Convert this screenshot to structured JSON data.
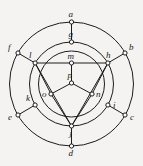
{
  "figure": {
    "top_strip_text": "· · · ··· ·· ·· · · ·· ·",
    "stroke_color": "#1c1c1c",
    "node_fill": "#ffffff",
    "background_color": "#f4f3f1",
    "canvas": {
      "width": 143,
      "height": 166
    },
    "center": {
      "x": 71.5,
      "y": 84
    },
    "circles": [
      {
        "name": "outer-circle",
        "radius": 62
      },
      {
        "name": "middle-circle",
        "radius": 42
      },
      {
        "name": "inner-circle",
        "radius": 33
      }
    ],
    "vertices": [
      {
        "id": "a",
        "label": "a",
        "ring": "outer",
        "x": 71.5,
        "y": 22,
        "label_dx": -3,
        "label_dy": -12
      },
      {
        "id": "b",
        "label": "b",
        "ring": "outer",
        "x": 125,
        "y": 53,
        "label_dx": 4,
        "label_dy": -10
      },
      {
        "id": "c",
        "label": "c",
        "ring": "outer",
        "x": 125,
        "y": 115,
        "label_dx": 5,
        "label_dy": -2
      },
      {
        "id": "d",
        "label": "d",
        "ring": "outer",
        "x": 71.5,
        "y": 146,
        "label_dx": -3,
        "label_dy": 3
      },
      {
        "id": "e",
        "label": "e",
        "ring": "outer",
        "x": 18,
        "y": 115,
        "label_dx": -10,
        "label_dy": -2
      },
      {
        "id": "f",
        "label": "f",
        "ring": "outer",
        "x": 18,
        "y": 53,
        "label_dx": -10,
        "label_dy": -10
      },
      {
        "id": "g",
        "label": "g",
        "ring": "middle",
        "x": 71.5,
        "y": 42,
        "label_dx": -3,
        "label_dy": -12
      },
      {
        "id": "h",
        "label": "h",
        "ring": "middle",
        "x": 107.9,
        "y": 63,
        "label_dx": -2,
        "label_dy": -12
      },
      {
        "id": "i",
        "label": "i",
        "ring": "middle",
        "x": 107.9,
        "y": 105,
        "label_dx": 5,
        "label_dy": -4
      },
      {
        "id": "j",
        "label": "j",
        "ring": "middle",
        "x": 71.5,
        "y": 126,
        "label_dx": -2,
        "label_dy": 3
      },
      {
        "id": "k",
        "label": "k",
        "ring": "middle",
        "x": 35.1,
        "y": 105,
        "label_dx": -9,
        "label_dy": -11
      },
      {
        "id": "l",
        "label": "l",
        "ring": "middle",
        "x": 35.1,
        "y": 63,
        "label_dx": -6,
        "label_dy": -12
      },
      {
        "id": "m",
        "label": "m",
        "ring": "inner",
        "x": 71.5,
        "y": 63,
        "label_dx": -4,
        "label_dy": -11
      },
      {
        "id": "n",
        "label": "n",
        "ring": "inner",
        "x": 92,
        "y": 94,
        "label_dx": 4,
        "label_dy": -4
      },
      {
        "id": "o",
        "label": "o",
        "ring": "inner",
        "x": 51,
        "y": 94,
        "label_dx": -9,
        "label_dy": -4
      },
      {
        "id": "p",
        "label": "p",
        "ring": "inner",
        "x": 71.5,
        "y": 83,
        "label_dx": -4,
        "label_dy": -12
      }
    ],
    "edges": [
      {
        "from": "a",
        "to": "g",
        "kind": "radial-spoke"
      },
      {
        "from": "b",
        "to": "h",
        "kind": "radial-spoke"
      },
      {
        "from": "c",
        "to": "i",
        "kind": "radial-spoke"
      },
      {
        "from": "d",
        "to": "j",
        "kind": "radial-spoke"
      },
      {
        "from": "e",
        "to": "k",
        "kind": "radial-spoke"
      },
      {
        "from": "f",
        "to": "l",
        "kind": "radial-spoke"
      },
      {
        "from": "l",
        "to": "h",
        "kind": "triangle-chord"
      },
      {
        "from": "l",
        "to": "j",
        "kind": "triangle-chord"
      },
      {
        "from": "h",
        "to": "j",
        "kind": "triangle-chord"
      },
      {
        "from": "m",
        "to": "p",
        "kind": "inner-spoke"
      },
      {
        "from": "p",
        "to": "o",
        "kind": "inner-spoke"
      },
      {
        "from": "p",
        "to": "n",
        "kind": "inner-spoke"
      },
      {
        "from": "o",
        "to": "l",
        "kind": "inner-spoke"
      },
      {
        "from": "o",
        "to": "j",
        "kind": "inner-spoke"
      },
      {
        "from": "n",
        "to": "h",
        "kind": "inner-spoke"
      },
      {
        "from": "n",
        "to": "j",
        "kind": "inner-spoke"
      }
    ]
  }
}
